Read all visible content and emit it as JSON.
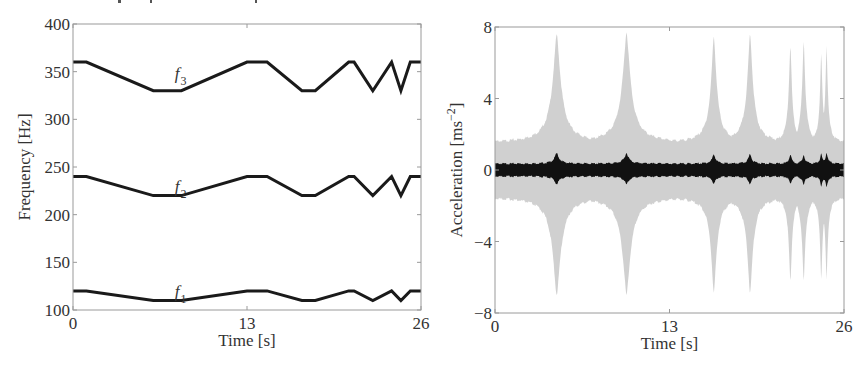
{
  "chart_data": [
    {
      "type": "line",
      "title": "",
      "xlabel": "Time [s]",
      "ylabel": "Frequency [Hz]",
      "xlim": [
        0,
        26
      ],
      "ylim": [
        100,
        400
      ],
      "xticks": [
        0,
        13,
        26
      ],
      "yticks": [
        100,
        150,
        200,
        250,
        300,
        350,
        400
      ],
      "grid": false,
      "legend": "none; inline labels",
      "x": [
        0,
        1.0,
        6.0,
        8.1,
        13.0,
        14.5,
        17.1,
        18.1,
        20.6,
        21.0,
        22.4,
        23.8,
        24.5,
        25.2,
        26
      ],
      "series": [
        {
          "name": "f3",
          "label_main": "f",
          "label_sub": "3",
          "label_at": [
            7.0,
            344
          ],
          "values": [
            360,
            360,
            330,
            330,
            360,
            360,
            330,
            330,
            360,
            360,
            330,
            360,
            330,
            360,
            360
          ]
        },
        {
          "name": "f2",
          "label_main": "f",
          "label_sub": "2",
          "label_at": [
            7.0,
            226
          ],
          "values": [
            240,
            240,
            220,
            220,
            240,
            240,
            220,
            220,
            240,
            240,
            220,
            240,
            220,
            240,
            240
          ]
        },
        {
          "name": "f1",
          "label_main": "f",
          "label_sub": "1",
          "label_at": [
            7.0,
            116
          ],
          "values": [
            120,
            120,
            110,
            110,
            120,
            120,
            110,
            110,
            120,
            120,
            110,
            120,
            110,
            120,
            120
          ]
        }
      ]
    },
    {
      "type": "area",
      "title": "",
      "xlabel": "Time [s]",
      "ylabel": "Acceleration [ms",
      "ylabel_sup": "−2",
      "ylabel_end": "]",
      "xlim": [
        0,
        26
      ],
      "ylim": [
        -8,
        8
      ],
      "xticks": [
        0,
        13,
        26
      ],
      "yticks": [
        -8,
        -4,
        0,
        4,
        8
      ],
      "ytick_labels": [
        "−8",
        "−4",
        "0",
        "4",
        "8"
      ],
      "grid": false,
      "series": [
        {
          "name": "envelope (light grey)",
          "color": "#c8c8c8",
          "baseline_amplitude": 1.5,
          "peaks": [
            {
              "t": 4.6,
              "upper": 7.6,
              "lower": -7.0,
              "width": 1.3
            },
            {
              "t": 9.8,
              "upper": 7.7,
              "lower": -7.0,
              "width": 1.3
            },
            {
              "t": 16.3,
              "upper": 7.5,
              "lower": -6.9,
              "width": 0.9
            },
            {
              "t": 19.0,
              "upper": 7.6,
              "lower": -6.9,
              "width": 0.9
            },
            {
              "t": 22.0,
              "upper": 7.0,
              "lower": -6.3,
              "width": 0.5
            },
            {
              "t": 23.0,
              "upper": 7.3,
              "lower": -6.3,
              "width": 0.5
            },
            {
              "t": 24.3,
              "upper": 6.5,
              "lower": -6.1,
              "width": 0.4
            },
            {
              "t": 24.7,
              "upper": 7.0,
              "lower": -6.2,
              "width": 0.4
            }
          ]
        },
        {
          "name": "response (black)",
          "color": "#111111",
          "baseline_amplitude": 0.35,
          "peaks": [
            {
              "t": 4.6,
              "upper": 0.95,
              "lower": -0.8,
              "width": 0.7
            },
            {
              "t": 9.8,
              "upper": 0.95,
              "lower": -0.8,
              "width": 0.7
            },
            {
              "t": 16.3,
              "upper": 0.9,
              "lower": -0.8,
              "width": 0.5
            },
            {
              "t": 19.0,
              "upper": 0.9,
              "lower": -0.8,
              "width": 0.5
            },
            {
              "t": 22.0,
              "upper": 0.9,
              "lower": -0.8,
              "width": 0.35
            },
            {
              "t": 23.0,
              "upper": 0.9,
              "lower": -0.9,
              "width": 0.35
            },
            {
              "t": 24.3,
              "upper": 0.9,
              "lower": -0.9,
              "width": 0.35
            },
            {
              "t": 24.7,
              "upper": 1.0,
              "lower": -1.0,
              "width": 0.35
            }
          ]
        }
      ]
    }
  ],
  "layout": {
    "left_plot": {
      "x0": 73,
      "x1": 421,
      "y0": 24,
      "y1": 310
    },
    "right_plot": {
      "x0": 495,
      "x1": 844,
      "y0": 27,
      "y1": 313
    },
    "colors": {
      "axis": "#9a9a9a",
      "line": "#1a1a1a",
      "envelope": "#c8c8c8",
      "response": "#111111"
    }
  }
}
